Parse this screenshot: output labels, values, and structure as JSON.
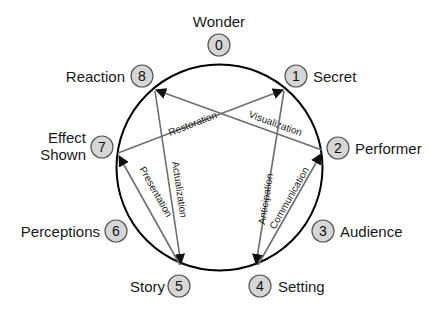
{
  "diagram": {
    "type": "cycle-with-cross-arrows",
    "nodes": [
      {
        "id": 0,
        "num": "0",
        "label": "Wonder"
      },
      {
        "id": 1,
        "num": "1",
        "label": "Secret"
      },
      {
        "id": 2,
        "num": "2",
        "label": "Performer"
      },
      {
        "id": 3,
        "num": "3",
        "label": "Audience"
      },
      {
        "id": 4,
        "num": "4",
        "label": "Setting"
      },
      {
        "id": 5,
        "num": "5",
        "label": "Story"
      },
      {
        "id": 6,
        "num": "6",
        "label": "Perceptions"
      },
      {
        "id": 7,
        "num": "7",
        "label_line1": "Effect",
        "label_line2": "Shown"
      },
      {
        "id": 8,
        "num": "8",
        "label": "Reaction"
      }
    ],
    "edges": [
      {
        "from": 7,
        "to": 1,
        "label": "Restoration"
      },
      {
        "from": 2,
        "to": 8,
        "label": "Visualization"
      },
      {
        "from": 8,
        "to": 5,
        "label": "Actualization"
      },
      {
        "from": 5,
        "to": 7,
        "label": "Presentation"
      },
      {
        "from": 1,
        "to": 4,
        "label": "Anticipation"
      },
      {
        "from": 4,
        "to": 2,
        "label": "Communication"
      }
    ],
    "colors": {
      "ring": "#000000",
      "edge": "#6e6e6e",
      "badge_fill": "#d6d6d6",
      "badge_stroke": "#555555"
    }
  }
}
